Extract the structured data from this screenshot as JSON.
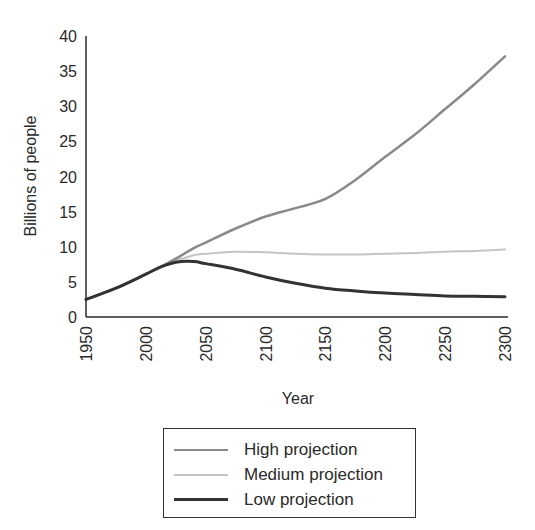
{
  "chart_data": {
    "type": "line",
    "title": "",
    "xlabel": "Year",
    "ylabel": "Billions of people",
    "xlim": [
      1950,
      2300
    ],
    "ylim": [
      0,
      40
    ],
    "x_ticks": [
      1950,
      2000,
      2050,
      2100,
      2150,
      2200,
      2250,
      2300
    ],
    "y_ticks": [
      0,
      5,
      10,
      15,
      20,
      25,
      30,
      35,
      40
    ],
    "grid": false,
    "legend_position": "bottom-center",
    "x": [
      1950,
      1975,
      2000,
      2012,
      2025,
      2040,
      2050,
      2075,
      2100,
      2125,
      2150,
      2175,
      2200,
      2225,
      2250,
      2275,
      2300
    ],
    "series": [
      {
        "name": "High projection",
        "color": "#8a8a8a",
        "values": [
          2.5,
          4.1,
          6.1,
          7.1,
          8.3,
          9.8,
          10.6,
          12.6,
          14.3,
          15.5,
          16.8,
          19.5,
          22.8,
          26.0,
          29.6,
          33.2,
          37.1
        ]
      },
      {
        "name": "Medium projection",
        "color": "#c4c4c4",
        "values": [
          2.5,
          4.1,
          6.1,
          7.1,
          8.0,
          8.8,
          9.0,
          9.3,
          9.2,
          9.0,
          8.9,
          8.9,
          9.0,
          9.1,
          9.3,
          9.4,
          9.6
        ]
      },
      {
        "name": "Low projection",
        "color": "#333333",
        "values": [
          2.5,
          4.1,
          6.1,
          7.1,
          7.8,
          7.9,
          7.6,
          6.8,
          5.7,
          4.8,
          4.1,
          3.7,
          3.4,
          3.2,
          3.0,
          2.95,
          2.9
        ]
      }
    ]
  },
  "axes": {
    "xlabel": "Year",
    "ylabel": "Billions of people"
  },
  "legend": {
    "items": [
      {
        "label": "High projection",
        "color": "#8a8a8a"
      },
      {
        "label": "Medium projection",
        "color": "#c4c4c4"
      },
      {
        "label": "Low projection",
        "color": "#333333"
      }
    ]
  }
}
